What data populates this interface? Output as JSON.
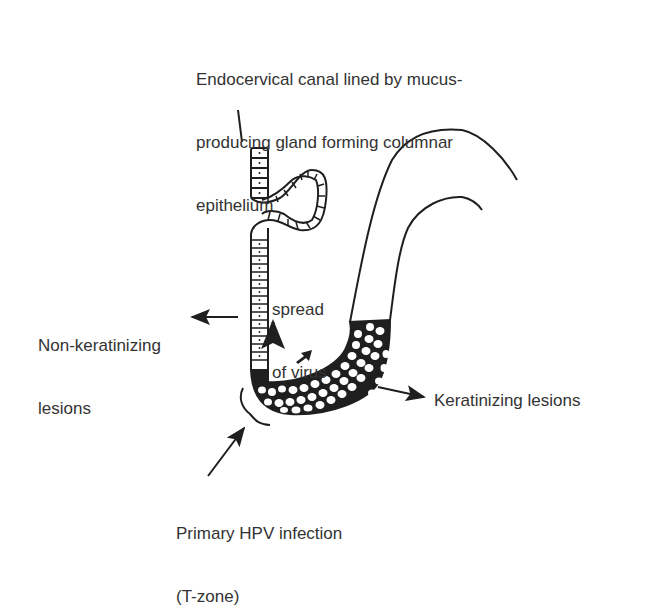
{
  "labels": {
    "endocervical": {
      "line1": "Endocervical canal lined by mucus-",
      "line2": "producing gland forming columnar",
      "line3": "epithelium"
    },
    "spread": {
      "line1": "spread",
      "line2": "of virus"
    },
    "non_keratinizing": {
      "line1": "Non-keratinizing",
      "line2": "lesions"
    },
    "keratinizing": "Keratinizing lesions",
    "primary_hpv": {
      "line1": "Primary HPV infection",
      "line2": "(T-zone)"
    }
  },
  "colors": {
    "ink": "#1f1f1f",
    "background": "#ffffff"
  }
}
